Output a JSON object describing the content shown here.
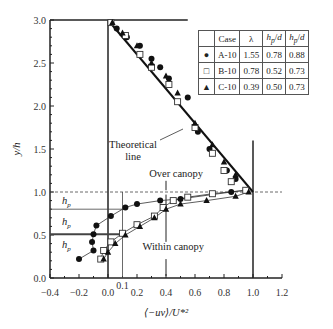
{
  "chart_data": {
    "type": "scatter",
    "title": "",
    "xlabel": "⟨−uv⟩/U*²",
    "ylabel": "y/h",
    "xlim": [
      -0.4,
      1.2
    ],
    "ylim": [
      0.0,
      3.0
    ],
    "xticks": [
      "−0.4",
      "−0.2",
      "0.0",
      "0.2",
      "0.4",
      "0.6",
      "0.8",
      "1.0",
      "1.2"
    ],
    "yticks": [
      "0.0",
      "0.5",
      "1.0",
      "1.5",
      "2.0",
      "2.5",
      "3.0"
    ],
    "extra_xtick": "0.1",
    "grid": false,
    "legend_table": {
      "headers": [
        "",
        "Case",
        "λ",
        "hp/d",
        "hp/d"
      ],
      "rows": [
        {
          "marker": "●",
          "case": "A-10",
          "lambda": "1.55",
          "hp_d1": "0.78",
          "hp_d2": "0.88"
        },
        {
          "marker": "□",
          "case": "B-10",
          "lambda": "0.78",
          "hp_d1": "0.52",
          "hp_d2": "0.73"
        },
        {
          "marker": "▲",
          "case": "C-10",
          "lambda": "0.39",
          "hp_d1": "0.50",
          "hp_d2": "0.73"
        }
      ]
    },
    "series": [
      {
        "name": "A-10",
        "marker": "filled-circle",
        "points": [
          [
            -0.2,
            0.22
          ],
          [
            -0.1,
            0.32
          ],
          [
            -0.11,
            0.42
          ],
          [
            -0.1,
            0.51
          ],
          [
            -0.08,
            0.61
          ],
          [
            0.02,
            0.72
          ],
          [
            0.12,
            0.82
          ],
          [
            0.2,
            0.86
          ],
          [
            0.36,
            0.9
          ],
          [
            0.5,
            0.92
          ],
          [
            0.85,
            1.0
          ],
          [
            0.95,
            1.02
          ],
          [
            0.88,
            1.15
          ],
          [
            0.82,
            1.25
          ],
          [
            0.7,
            1.5
          ],
          [
            0.62,
            1.7
          ],
          [
            0.55,
            2.1
          ],
          [
            0.42,
            2.32
          ],
          [
            0.36,
            2.45
          ],
          [
            0.3,
            2.55
          ],
          [
            0.22,
            2.7
          ],
          [
            0.13,
            2.8
          ],
          [
            0.06,
            2.9
          ],
          [
            0.02,
            2.97
          ]
        ]
      },
      {
        "name": "B-10",
        "marker": "open-square",
        "points": [
          [
            -0.05,
            0.22
          ],
          [
            -0.03,
            0.32
          ],
          [
            0.02,
            0.42
          ],
          [
            0.1,
            0.52
          ],
          [
            0.2,
            0.62
          ],
          [
            0.32,
            0.72
          ],
          [
            0.38,
            0.82
          ],
          [
            0.45,
            0.9
          ],
          [
            0.55,
            0.94
          ],
          [
            0.72,
            0.98
          ],
          [
            0.95,
            1.02
          ],
          [
            0.85,
            1.12
          ],
          [
            0.8,
            1.25
          ],
          [
            0.72,
            1.45
          ],
          [
            0.6,
            1.75
          ],
          [
            0.48,
            2.05
          ],
          [
            0.42,
            2.25
          ],
          [
            0.3,
            2.45
          ],
          [
            0.22,
            2.6
          ],
          [
            0.12,
            2.82
          ],
          [
            0.02,
            2.97
          ]
        ]
      },
      {
        "name": "C-10",
        "marker": "filled-triangle",
        "points": [
          [
            -0.03,
            0.22
          ],
          [
            0.0,
            0.3
          ],
          [
            0.05,
            0.4
          ],
          [
            0.12,
            0.5
          ],
          [
            0.22,
            0.6
          ],
          [
            0.32,
            0.7
          ],
          [
            0.4,
            0.8
          ],
          [
            0.5,
            0.86
          ],
          [
            0.68,
            0.9
          ],
          [
            0.88,
            0.95
          ],
          [
            0.97,
            1.0
          ],
          [
            0.88,
            1.2
          ],
          [
            0.8,
            1.35
          ],
          [
            0.72,
            1.55
          ],
          [
            0.6,
            1.8
          ],
          [
            0.48,
            2.15
          ],
          [
            0.4,
            2.35
          ],
          [
            0.3,
            2.5
          ],
          [
            0.2,
            2.7
          ],
          [
            0.1,
            2.85
          ],
          [
            0.03,
            2.97
          ]
        ]
      }
    ],
    "theoretical_line": [
      [
        0.0,
        3.0
      ],
      [
        1.0,
        1.0
      ]
    ],
    "annotations": {
      "theoretical_line": "Theoretical line",
      "over_canopy": "Over canopy",
      "within_canopy": "Within canopy",
      "hp": "hp"
    }
  },
  "labels": {
    "theoretical_1": "Theoretical",
    "theoretical_2": "line",
    "over_canopy": "Over canopy",
    "within_canopy": "Within canopy",
    "hp": "h",
    "hp_sub": "p",
    "xlabel": "⟨−uv⟩/U*²",
    "ylabel": "y/h"
  }
}
